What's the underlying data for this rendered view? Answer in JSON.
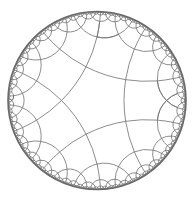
{
  "diagram": {
    "type": "hyperbolic-tiling",
    "model": "poincare-disk",
    "schlafli": {
      "p": 5,
      "q": 4
    },
    "disk": {
      "cx": 97,
      "cy": 100.5,
      "r": 89
    },
    "rotation_deg": 180,
    "max_depth": 6,
    "colors": {
      "background": "#ffffff",
      "edge": "#6f6f6f",
      "rim": "#6a6a6a"
    }
  }
}
